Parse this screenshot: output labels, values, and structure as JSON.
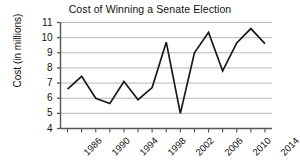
{
  "chart_data": {
    "type": "line",
    "title": "Cost of Winning a Senate Election",
    "xlabel": "",
    "ylabel": "Cost (in millions)",
    "x": [
      1986,
      1988,
      1990,
      1992,
      1994,
      1996,
      1998,
      2000,
      2002,
      2004,
      2006,
      2008,
      2010,
      2012,
      2014
    ],
    "values": [
      6.6,
      7.45,
      6.0,
      5.65,
      7.1,
      5.9,
      6.7,
      9.7,
      5.0,
      9.0,
      10.35,
      7.8,
      9.65,
      10.6,
      9.6
    ],
    "categories": [
      "1986",
      "1988",
      "1990",
      "1992",
      "1994",
      "1996",
      "1998",
      "2000",
      "2002",
      "2004",
      "2006",
      "2008",
      "2010",
      "2012",
      "2014"
    ],
    "series": [
      {
        "name": "Cost of Winning a Senate Election",
        "values": [
          6.6,
          7.45,
          6.0,
          5.65,
          7.1,
          5.9,
          6.7,
          9.7,
          5.0,
          9.0,
          10.35,
          7.8,
          9.65,
          10.6,
          9.6
        ]
      }
    ],
    "xlim": [
      1985,
      2015
    ],
    "ylim": [
      4,
      11
    ],
    "y_ticks": [
      4,
      5,
      6,
      7,
      8,
      9,
      10,
      11
    ],
    "y_tick_labels": [
      "4",
      "5",
      "6",
      "7",
      "8",
      "9",
      "10",
      "11"
    ],
    "x_ticks": [
      1986,
      1988,
      1990,
      1992,
      1994,
      1996,
      1998,
      2000,
      2002,
      2004,
      2006,
      2008,
      2010,
      2012,
      2014
    ],
    "x_tick_labels_shown": [
      "1986",
      "1990",
      "1994",
      "1998",
      "2002",
      "2006",
      "2010",
      "2014"
    ],
    "x_tick_label_rotation": -45,
    "grid": "horizontal",
    "legend": "none",
    "line_color": "#1a1a1a",
    "grid_color": "#b9b9b9",
    "axis_color": "#555555",
    "background_color": "#ffffff"
  }
}
